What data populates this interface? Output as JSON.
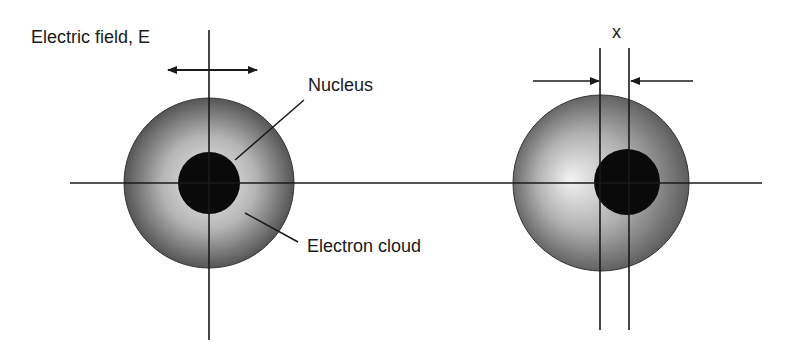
{
  "labels": {
    "electric_field": "Electric field, E",
    "nucleus": "Nucleus",
    "electron_cloud": "Electron cloud",
    "displacement": "x"
  },
  "colors": {
    "line": "#1a1a1a",
    "nucleus": "#0a0a0a",
    "cloud_light": "#e8e8e8",
    "cloud_dark": "#5a5a5a"
  }
}
